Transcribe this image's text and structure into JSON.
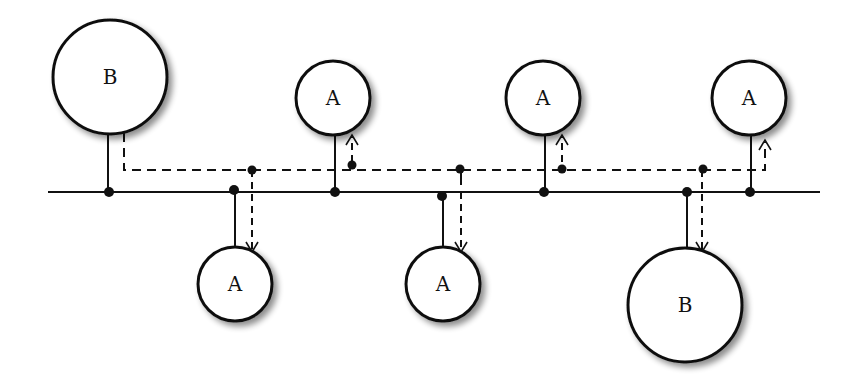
{
  "diagram": {
    "colors": {
      "stroke": "#111111",
      "background": "#ffffff",
      "shadow": "#9a9a9a"
    },
    "bus": {
      "y": 192,
      "x1": 48,
      "x2": 820
    },
    "signal_line": {
      "y": 170,
      "x_start": 124,
      "x_end": 765
    },
    "nodes": [
      {
        "id": "b1",
        "label": "B",
        "cx": 110,
        "cy": 77,
        "r": 57,
        "position": "top"
      },
      {
        "id": "a1",
        "label": "A",
        "cx": 333,
        "cy": 98,
        "r": 37,
        "position": "top"
      },
      {
        "id": "a2",
        "label": "A",
        "cx": 543,
        "cy": 98,
        "r": 37,
        "position": "top"
      },
      {
        "id": "a3",
        "label": "A",
        "cx": 749,
        "cy": 98,
        "r": 37,
        "position": "top"
      },
      {
        "id": "a4",
        "label": "A",
        "cx": 235,
        "cy": 284,
        "r": 37,
        "position": "bottom"
      },
      {
        "id": "a5",
        "label": "A",
        "cx": 443,
        "cy": 284,
        "r": 37,
        "position": "bottom"
      },
      {
        "id": "b2",
        "label": "B",
        "cx": 685,
        "cy": 305,
        "r": 57,
        "position": "bottom"
      }
    ]
  }
}
